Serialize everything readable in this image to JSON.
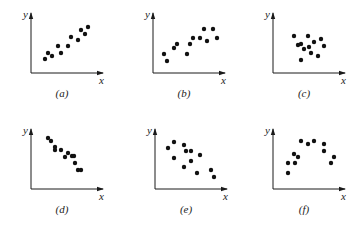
{
  "figure": {
    "panels": [
      {
        "id": "a",
        "caption": "(a)",
        "x_label": "x",
        "y_label": "y",
        "ox": 31,
        "oy": 73,
        "pattern": "strong positive linear",
        "points": [
          [
            45,
            59
          ],
          [
            48,
            53
          ],
          [
            52,
            56
          ],
          [
            58,
            46
          ],
          [
            61,
            53
          ],
          [
            68,
            46
          ],
          [
            71,
            37
          ],
          [
            78,
            40
          ],
          [
            81,
            30
          ],
          [
            85,
            34
          ],
          [
            88,
            27
          ]
        ]
      },
      {
        "id": "b",
        "caption": "(b)",
        "x_label": "x",
        "y_label": "y",
        "ox": 153,
        "oy": 73,
        "pattern": "weak positive linear",
        "points": [
          [
            164,
            54
          ],
          [
            167,
            61
          ],
          [
            174,
            48
          ],
          [
            177,
            44
          ],
          [
            187,
            54
          ],
          [
            190,
            44
          ],
          [
            193,
            38
          ],
          [
            200,
            38
          ],
          [
            204,
            29
          ],
          [
            207,
            41
          ],
          [
            213,
            29
          ],
          [
            217,
            38
          ]
        ]
      },
      {
        "id": "c",
        "caption": "(c)",
        "x_label": "x",
        "y_label": "y",
        "ox": 273,
        "oy": 73,
        "pattern": "no correlation",
        "points": [
          [
            294,
            36
          ],
          [
            298,
            45
          ],
          [
            301,
            44
          ],
          [
            301,
            60
          ],
          [
            304,
            49
          ],
          [
            308,
            36
          ],
          [
            309,
            47
          ],
          [
            311,
            53
          ],
          [
            314,
            42
          ],
          [
            318,
            56
          ],
          [
            321,
            39
          ],
          [
            324,
            46
          ]
        ]
      },
      {
        "id": "d",
        "caption": "(d)",
        "x_label": "x",
        "y_label": "y",
        "ox": 31,
        "oy": 189,
        "pattern": "strong negative linear",
        "points": [
          [
            48,
            138
          ],
          [
            51,
            141
          ],
          [
            55,
            147
          ],
          [
            55,
            150
          ],
          [
            61,
            150
          ],
          [
            65,
            157
          ],
          [
            68,
            153
          ],
          [
            72,
            156
          ],
          [
            74,
            156
          ],
          [
            75,
            163
          ],
          [
            78,
            170
          ],
          [
            81,
            170
          ]
        ]
      },
      {
        "id": "e",
        "caption": "(e)",
        "x_label": "x",
        "y_label": "y",
        "ox": 155,
        "oy": 189,
        "pattern": "weak negative linear",
        "points": [
          [
            168,
            148
          ],
          [
            174,
            142
          ],
          [
            174,
            158
          ],
          [
            184,
            145
          ],
          [
            186,
            151
          ],
          [
            184,
            167
          ],
          [
            191,
            161
          ],
          [
            191,
            151
          ],
          [
            200,
            155
          ],
          [
            197,
            173
          ],
          [
            211,
            170
          ],
          [
            214,
            177
          ]
        ]
      },
      {
        "id": "f",
        "caption": "(f)",
        "x_label": "x",
        "y_label": "y",
        "ox": 273,
        "oy": 189,
        "pattern": "nonlinear (inverted U)",
        "points": [
          [
            288,
            173
          ],
          [
            288,
            163
          ],
          [
            294,
            154
          ],
          [
            295,
            163
          ],
          [
            298,
            157
          ],
          [
            301,
            141
          ],
          [
            308,
            144
          ],
          [
            314,
            141
          ],
          [
            324,
            144
          ],
          [
            324,
            151
          ],
          [
            331,
            163
          ],
          [
            334,
            157
          ]
        ]
      }
    ]
  }
}
